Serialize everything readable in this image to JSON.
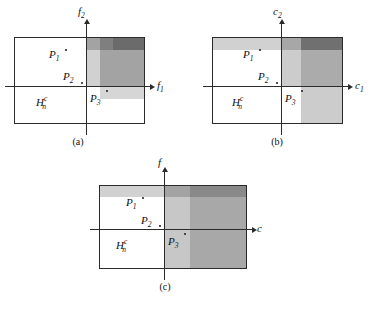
{
  "figure": {
    "panels": [
      {
        "id": "a",
        "caption": "(a)",
        "x_axis_label": "f",
        "x_axis_sub": "1",
        "y_axis_label": "f",
        "y_axis_sub": "2",
        "points": [
          {
            "name": "P",
            "sub": "1"
          },
          {
            "name": "P",
            "sub": "2"
          },
          {
            "name": "P",
            "sub": "3"
          }
        ],
        "region_label": {
          "base": "H",
          "sup": "c",
          "sub": "n"
        }
      },
      {
        "id": "b",
        "caption": "(b)",
        "x_axis_label": "c",
        "x_axis_sub": "1",
        "y_axis_label": "c",
        "y_axis_sub": "2",
        "points": [
          {
            "name": "P",
            "sub": "1"
          },
          {
            "name": "P",
            "sub": "2"
          },
          {
            "name": "P",
            "sub": "3"
          }
        ],
        "region_label": {
          "base": "H",
          "sup": "c",
          "sub": "n"
        }
      },
      {
        "id": "c",
        "caption": "(c)",
        "x_axis_label": "c",
        "x_axis_sub": "",
        "y_axis_label": "f",
        "y_axis_sub": "",
        "points": [
          {
            "name": "P",
            "sub": "1"
          },
          {
            "name": "P",
            "sub": "2"
          },
          {
            "name": "P",
            "sub": "3"
          }
        ],
        "region_label": {
          "base": "H",
          "sup": "c",
          "sub": "n"
        }
      }
    ],
    "colors": {
      "line": "#2b2b2b",
      "text": "#111111",
      "shade_light": "#d9d9d9",
      "shade_medium": "#c0c0c0",
      "shade_dark": "#8f8f8f",
      "background": "#ffffff"
    }
  }
}
